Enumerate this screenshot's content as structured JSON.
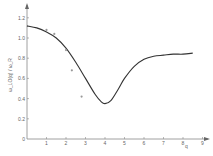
{
  "chart_data": {
    "type": "line",
    "title": "",
    "xlabel": "q",
    "ylabel": "ω_LO(q) / ω_R",
    "xlim": [
      0,
      9.5
    ],
    "ylim": [
      0,
      1.25
    ],
    "grid": false,
    "legend": "none",
    "x_ticks": [
      "1",
      "2",
      "3",
      "4",
      "5",
      "6",
      "7",
      "8",
      "9"
    ],
    "y_ticks": [
      "0",
      "0.2",
      "0.4",
      "0.6",
      "0.8",
      "1.0",
      "1.2"
    ],
    "series": [
      {
        "name": "theory-curve",
        "style": "line",
        "x": [
          0,
          0.5,
          1,
          1.5,
          2,
          2.5,
          3,
          3.5,
          3.8,
          4,
          4.3,
          4.7,
          5,
          5.5,
          6,
          6.5,
          7,
          7.5,
          8,
          8.5
        ],
        "y": [
          1.12,
          1.1,
          1.06,
          1.0,
          0.9,
          0.76,
          0.6,
          0.44,
          0.37,
          0.35,
          0.38,
          0.5,
          0.6,
          0.72,
          0.79,
          0.82,
          0.83,
          0.84,
          0.84,
          0.85
        ]
      },
      {
        "name": "experiment-points",
        "style": "scatter",
        "x": [
          1.0,
          1.4,
          2.0,
          2.3,
          2.8
        ],
        "y": [
          1.08,
          1.04,
          0.88,
          0.68,
          0.42
        ]
      }
    ]
  },
  "axes": {
    "origin_label": "0",
    "x_axis_label": "q",
    "y_axis_label": "ω_LO(q) / ω_R"
  }
}
